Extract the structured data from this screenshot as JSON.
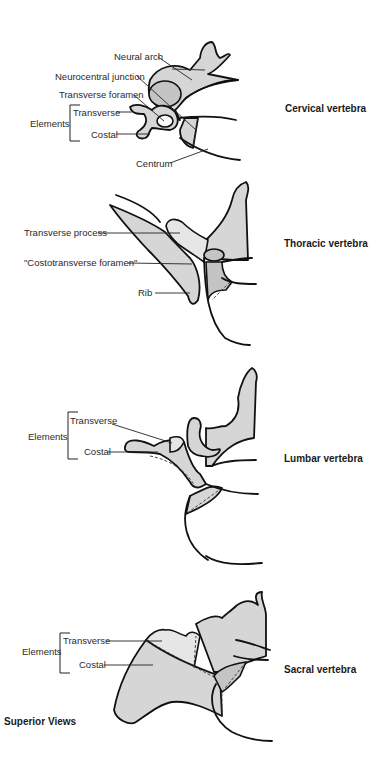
{
  "figure": {
    "view_label": "Superior Views",
    "colors": {
      "bone_fill": "#d6d6d6",
      "bone_dark": "#c4c4c4",
      "outline": "#111111"
    }
  },
  "panels": [
    {
      "title": "Cervical vertebra",
      "labels": {
        "neural_arch": "Neural arch",
        "neurocentral_junction": "Neurocentral junction",
        "transverse_foramen": "Transverse foramen",
        "elements": "Elements",
        "transverse": "Transverse",
        "costal": "Costal",
        "centrum": "Centrum"
      }
    },
    {
      "title": "Thoracic vertebra",
      "labels": {
        "transverse_process": "Transverse process",
        "costotransverse_foramen": "\"Costotransverse foramen\"",
        "rib": "Rib"
      }
    },
    {
      "title": "Lumbar vertebra",
      "labels": {
        "elements": "Elements",
        "transverse": "Transverse",
        "costal": "Costal"
      }
    },
    {
      "title": "Sacral vertebra",
      "labels": {
        "elements": "Elements",
        "transverse": "Transverse",
        "costal": "Costal"
      }
    }
  ]
}
